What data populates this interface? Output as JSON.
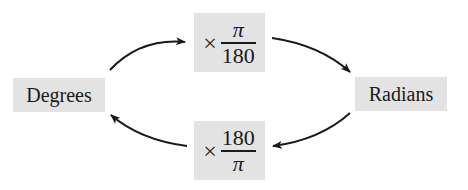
{
  "nodes": {
    "degrees": {
      "label": "Degrees"
    },
    "radians": {
      "label": "Radians"
    }
  },
  "conversions": {
    "deg_to_rad": {
      "operator": "×",
      "numerator": "π",
      "denominator": "180"
    },
    "rad_to_deg": {
      "operator": "×",
      "numerator": "180",
      "denominator": "π"
    }
  },
  "edges": [
    {
      "from": "Degrees",
      "to": "×π/180",
      "direction": "up-right"
    },
    {
      "from": "×π/180",
      "to": "Radians",
      "direction": "down-right"
    },
    {
      "from": "Radians",
      "to": "×180/π",
      "direction": "down-left"
    },
    {
      "from": "×180/π",
      "to": "Degrees",
      "direction": "up-left"
    }
  ],
  "colors": {
    "box_fill": "#e3e3e3",
    "stroke": "#1a1a1a",
    "background": "#ffffff"
  }
}
